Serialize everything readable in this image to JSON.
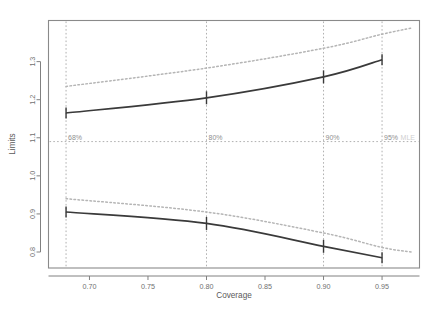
{
  "chart_data": {
    "type": "line",
    "title": "",
    "xlabel": "Coverage",
    "ylabel": "Limits",
    "xlim": [
      0.665,
      0.982
    ],
    "ylim": [
      0.758,
      1.408
    ],
    "grid": false,
    "legend": null,
    "xticks": [
      0.7,
      0.75,
      0.8,
      0.85,
      0.9,
      0.95
    ],
    "xticklabels": [
      "0.70",
      "0.75",
      "0.80",
      "0.85",
      "0.90",
      "0.95"
    ],
    "yticks": [
      0.8,
      0.9,
      1.0,
      1.1,
      1.2,
      1.3
    ],
    "yticklabels": [
      "0.8",
      "0.9",
      "1.0",
      "1.1",
      "1.2",
      "1.3"
    ],
    "series": [
      {
        "name": "upper-limit-solid",
        "style": "solid",
        "color": "#3a3a3a",
        "x": [
          0.68,
          0.8,
          0.9,
          0.95
        ],
        "values": [
          1.165,
          1.205,
          1.26,
          1.305
        ],
        "markers": "vertical-tick"
      },
      {
        "name": "lower-limit-solid",
        "style": "solid",
        "color": "#3a3a3a",
        "x": [
          0.68,
          0.8,
          0.9,
          0.95
        ],
        "values": [
          0.905,
          0.875,
          0.815,
          0.785
        ],
        "markers": "vertical-tick"
      },
      {
        "name": "upper-limit-dotted",
        "style": "dotted",
        "color": "#b5b5b5",
        "x": [
          0.68,
          0.8,
          0.9,
          0.95,
          0.975
        ],
        "values": [
          1.235,
          1.283,
          1.335,
          1.372,
          1.388
        ]
      },
      {
        "name": "lower-limit-dotted",
        "style": "dotted",
        "color": "#b5b5b5",
        "x": [
          0.68,
          0.8,
          0.9,
          0.95,
          0.975
        ],
        "values": [
          0.94,
          0.905,
          0.85,
          0.812,
          0.8
        ]
      }
    ],
    "reference_line": {
      "name": "mle-horizontal",
      "orientation": "horizontal",
      "value": 1.09,
      "style": "dashed",
      "color": "#b0b0b0",
      "label": "MLE"
    },
    "vertical_guides": [
      {
        "x": 0.68,
        "label": "68%"
      },
      {
        "x": 0.8,
        "label": "80%"
      },
      {
        "x": 0.9,
        "label": "90%"
      },
      {
        "x": 0.95,
        "label": "95%"
      }
    ],
    "annotations": [
      {
        "text": "68%",
        "x": 0.68,
        "y": 1.09
      },
      {
        "text": "80%",
        "x": 0.8,
        "y": 1.09
      },
      {
        "text": "90%",
        "x": 0.9,
        "y": 1.09
      },
      {
        "text": "95%",
        "x": 0.95,
        "y": 1.09
      },
      {
        "text": "MLE",
        "x": 0.972,
        "y": 1.09
      }
    ],
    "colors": {
      "solid": "#3a3a3a",
      "dotted": "#b5b5b5",
      "guide": "#b0b0b0",
      "frame": "#8a8a8a",
      "text": "#707070",
      "background": "#ffffff"
    }
  }
}
